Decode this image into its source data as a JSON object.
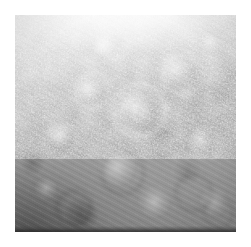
{
  "page": {
    "background_color": "#ffffff",
    "width_px": 251,
    "height_px": 247,
    "caption": "",
    "title": "",
    "has_visible_text": false
  },
  "figure": {
    "name": "grayscale-micrograph",
    "panel": {
      "left_px": 15,
      "top_px": 15,
      "width_px": 221,
      "height_px": 217,
      "border": "none",
      "background_color": "#9a9a9a"
    },
    "appearance": {
      "colorspace": "grayscale",
      "highlight_color": "#ffffff",
      "midtone_color": "#a8a8a8",
      "shadow_color": "#3a3a3a",
      "bottom_band_color": "#2a2a2a",
      "brightest_region": "top-center",
      "darkest_region": "bottom-left",
      "texture": "fine speckle noise over low-frequency blobs",
      "striation_angle_deg": 28
    },
    "rings": [
      {
        "name": "ring-center-large",
        "cx_pct": 54,
        "cy_pct": 42,
        "r_px": 24,
        "thickness_px": 5,
        "tone": "light",
        "alpha": 0.55
      },
      {
        "name": "ring-center-inner",
        "cx_pct": 55,
        "cy_pct": 44,
        "r_px": 12,
        "thickness_px": 4,
        "tone": "dark",
        "alpha": 0.4
      },
      {
        "name": "ring-upper-left",
        "cx_pct": 33,
        "cy_pct": 33,
        "r_px": 16,
        "thickness_px": 4,
        "tone": "light",
        "alpha": 0.5
      },
      {
        "name": "ring-upper-right",
        "cx_pct": 74,
        "cy_pct": 26,
        "r_px": 18,
        "thickness_px": 4,
        "tone": "light",
        "alpha": 0.42
      },
      {
        "name": "ring-mid-left",
        "cx_pct": 19,
        "cy_pct": 56,
        "r_px": 14,
        "thickness_px": 4,
        "tone": "light",
        "alpha": 0.4
      },
      {
        "name": "ring-mid-right",
        "cx_pct": 85,
        "cy_pct": 57,
        "r_px": 13,
        "thickness_px": 4,
        "tone": "light",
        "alpha": 0.38
      },
      {
        "name": "ring-lower-center",
        "cx_pct": 47,
        "cy_pct": 71,
        "r_px": 19,
        "thickness_px": 4,
        "tone": "dark",
        "alpha": 0.32
      },
      {
        "name": "ring-lower-left",
        "cx_pct": 25,
        "cy_pct": 87,
        "r_px": 15,
        "thickness_px": 4,
        "tone": "dark",
        "alpha": 0.3
      },
      {
        "name": "ring-lower-right",
        "cx_pct": 79,
        "cy_pct": 80,
        "r_px": 16,
        "thickness_px": 4,
        "tone": "dark",
        "alpha": 0.28
      },
      {
        "name": "ring-top-center",
        "cx_pct": 44,
        "cy_pct": 13,
        "r_px": 12,
        "thickness_px": 3,
        "tone": "light",
        "alpha": 0.45
      },
      {
        "name": "ring-bottom-right-edge",
        "cx_pct": 91,
        "cy_pct": 90,
        "r_px": 13,
        "thickness_px": 3,
        "tone": "dark",
        "alpha": 0.26
      },
      {
        "name": "ring-center-right",
        "cx_pct": 66,
        "cy_pct": 58,
        "r_px": 11,
        "thickness_px": 3,
        "tone": "dark",
        "alpha": 0.3
      }
    ]
  }
}
